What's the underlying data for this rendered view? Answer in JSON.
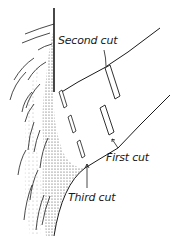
{
  "figure": {
    "labels": {
      "second_cut": "Second cut",
      "first_cut": "First cut",
      "third_cut": "Third cut"
    },
    "colors": {
      "ink": "#1a1a1a",
      "shading": "#333333",
      "background": "#ffffff"
    }
  }
}
